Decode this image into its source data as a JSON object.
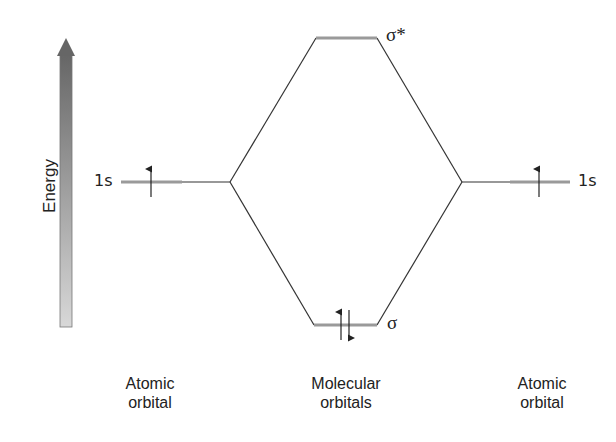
{
  "axis": {
    "label": "Energy",
    "direction": "up"
  },
  "atomic_orbitals": [
    {
      "side": "left",
      "label": "1s",
      "electrons": [
        "up"
      ],
      "caption_line1": "Atomic",
      "caption_line2": "orbital"
    },
    {
      "side": "right",
      "label": "1s",
      "electrons": [
        "up"
      ],
      "caption_line1": "Atomic",
      "caption_line2": "orbital"
    }
  ],
  "molecular_orbitals": {
    "antibonding": {
      "label": "σ*",
      "electrons": []
    },
    "bonding": {
      "label": "σ",
      "electrons": [
        "up",
        "down"
      ]
    },
    "caption_line1": "Molecular",
    "caption_line2": "orbitals"
  },
  "colors": {
    "level_line": "#9a9a9a",
    "connector_line": "#333333",
    "arrow_top": "#6a6a6a",
    "arrow_bottom": "#d6d6d6"
  }
}
